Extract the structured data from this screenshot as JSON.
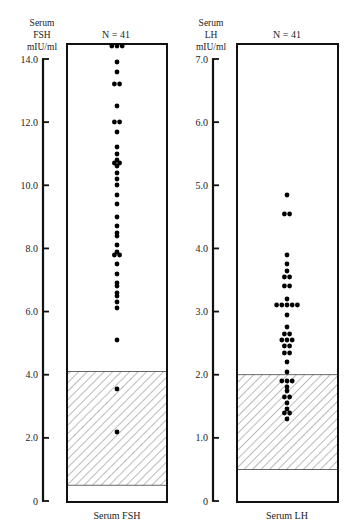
{
  "chart_data": [
    {
      "type": "scatter",
      "subtype": "dot-strip",
      "title": "N = 41",
      "xlabel": "Serum  FSH",
      "ylabel": [
        "Serum",
        "FSH",
        "mIU/ml"
      ],
      "ylim": [
        0,
        14.0
      ],
      "yticks": [
        0,
        2.0,
        4.0,
        6.0,
        8.0,
        10.0,
        12.0,
        14.0
      ],
      "ytick_labels": [
        "0",
        "2.0",
        "4.0",
        "6.0",
        "8.0",
        "10.0",
        "12.0",
        "14.0"
      ],
      "normal_range": [
        0.5,
        4.1
      ],
      "normal_range_style": "hatched",
      "n": 41,
      "values": [
        14.4,
        14.4,
        14.4,
        13.9,
        13.6,
        13.2,
        13.2,
        12.5,
        12.0,
        12.0,
        11.7,
        11.2,
        11.0,
        10.8,
        10.7,
        10.7,
        10.6,
        10.4,
        10.2,
        10.0,
        9.7,
        9.4,
        9.0,
        8.7,
        8.5,
        8.4,
        8.1,
        7.9,
        7.8,
        7.8,
        7.5,
        7.2,
        6.9,
        6.8,
        6.6,
        6.5,
        6.3,
        6.1,
        5.1,
        3.55,
        2.2
      ],
      "grid": false
    },
    {
      "type": "scatter",
      "subtype": "dot-strip",
      "title": "N = 41",
      "xlabel": "Serum LH",
      "ylabel": [
        "Serum",
        "LH",
        "mIU/ml"
      ],
      "ylim": [
        0,
        7.0
      ],
      "yticks": [
        0,
        1.0,
        2.0,
        3.0,
        4.0,
        5.0,
        6.0,
        7.0
      ],
      "ytick_labels": [
        "0",
        "1.0",
        "2.0",
        "3.0",
        "4.0",
        "5.0",
        "6.0",
        "7.0"
      ],
      "normal_range": [
        0.5,
        2.0
      ],
      "normal_range_style": "hatched",
      "n": 41,
      "values": [
        4.85,
        4.55,
        4.55,
        3.9,
        3.75,
        3.65,
        3.55,
        3.55,
        3.4,
        3.4,
        3.2,
        3.1,
        3.1,
        3.1,
        3.1,
        3.1,
        2.95,
        2.75,
        2.65,
        2.65,
        2.55,
        2.55,
        2.55,
        2.45,
        2.45,
        2.35,
        2.35,
        2.2,
        2.05,
        1.9,
        1.9,
        1.9,
        1.8,
        1.75,
        1.65,
        1.65,
        1.55,
        1.45,
        1.4,
        1.4,
        1.3
      ],
      "grid": false
    }
  ]
}
